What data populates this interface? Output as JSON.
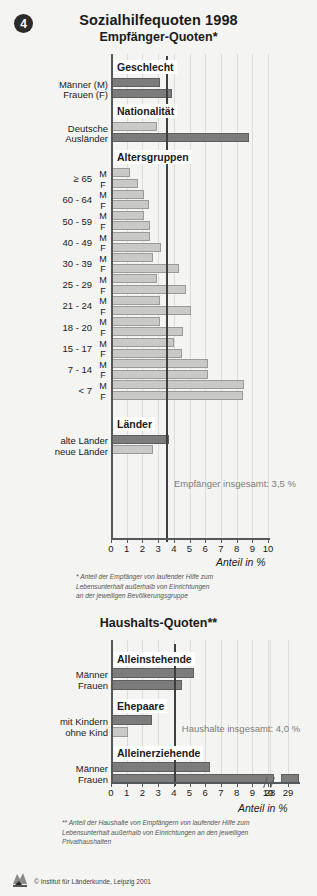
{
  "badge": {
    "number": "4"
  },
  "header": {
    "title": "Sozialhilfequoten 1998",
    "subtitle_top": "Empfänger-Quoten*",
    "subtitle_bottom": "Haushalts-Quoten**"
  },
  "axis": {
    "caption": "Anteil in %",
    "ticks_top": [
      "0",
      "1",
      "2",
      "3",
      "4",
      "5",
      "6",
      "7",
      "8",
      "9",
      "10"
    ],
    "ticks_bottom": [
      "0",
      "1",
      "2",
      "3",
      "4",
      "5",
      "6",
      "7",
      "8",
      "9",
      "10",
      "28",
      "29"
    ]
  },
  "annotations": {
    "top_reference": "Empfänger insgesamt: 3,5 %",
    "bottom_reference": "Haushalte insgesamt: 4,0 %"
  },
  "footnotes": {
    "one": "* Anteil der Empfänger von laufender Hilfe zum\nLebensunterhalt außerhalb von Einrichtungen\nan der jeweiligen Bevölkerungsgruppe",
    "two": "** Anteil der Haushalte von Empfängern von laufender Hilfe zum\nLebensunterhalt außerhalb von Einrichtungen an den jeweiligen\nPrivathaushalten"
  },
  "copyright": "© Institut für Länderkunde, Leipzig 2001",
  "colors": {
    "bar_dark": "#7c7c7c",
    "bar_light": "#c9c9c7",
    "reference_line": "#3d3f41",
    "axis": "#55585a",
    "background": "#f4f4f2"
  },
  "chart_data": [
    {
      "type": "bar",
      "orientation": "horizontal",
      "title": "Sozialhilfequoten 1998 — Empfänger-Quoten*",
      "xlabel": "Anteil in %",
      "ylabel": "",
      "xlim": [
        0,
        10
      ],
      "grid": true,
      "reference_line": {
        "value": 3.5,
        "label": "Empfänger insgesamt: 3,5 %"
      },
      "groups": [
        {
          "name": "Geschlecht",
          "rows": [
            {
              "label": "Männer (M)",
              "sex": "",
              "value": 3.1,
              "shade": "dark"
            },
            {
              "label": "Frauen (F)",
              "sex": "",
              "value": 3.9,
              "shade": "dark"
            }
          ]
        },
        {
          "name": "Nationalität",
          "rows": [
            {
              "label": "Deutsche",
              "sex": "",
              "value": 2.9,
              "shade": "light"
            },
            {
              "label": "Ausländer",
              "sex": "",
              "value": 8.8,
              "shade": "dark"
            }
          ]
        },
        {
          "name": "Altersgruppen",
          "rows": [
            {
              "label": "≥ 65",
              "sex": "M",
              "value": 1.2,
              "shade": "light"
            },
            {
              "label": "≥ 65",
              "sex": "F",
              "value": 1.7,
              "shade": "light"
            },
            {
              "label": "60 - 64",
              "sex": "M",
              "value": 2.1,
              "shade": "light"
            },
            {
              "label": "60 - 64",
              "sex": "F",
              "value": 2.4,
              "shade": "light"
            },
            {
              "label": "50 - 59",
              "sex": "M",
              "value": 2.1,
              "shade": "light"
            },
            {
              "label": "50 - 59",
              "sex": "F",
              "value": 2.5,
              "shade": "light"
            },
            {
              "label": "40 - 49",
              "sex": "M",
              "value": 2.5,
              "shade": "light"
            },
            {
              "label": "40 - 49",
              "sex": "F",
              "value": 3.2,
              "shade": "light"
            },
            {
              "label": "30 - 39",
              "sex": "M",
              "value": 2.7,
              "shade": "light"
            },
            {
              "label": "30 - 39",
              "sex": "F",
              "value": 4.3,
              "shade": "light"
            },
            {
              "label": "25 - 29",
              "sex": "M",
              "value": 2.9,
              "shade": "light"
            },
            {
              "label": "25 - 29",
              "sex": "F",
              "value": 4.8,
              "shade": "light"
            },
            {
              "label": "21 - 24",
              "sex": "M",
              "value": 3.1,
              "shade": "light"
            },
            {
              "label": "21 - 24",
              "sex": "F",
              "value": 5.1,
              "shade": "light"
            },
            {
              "label": "18 - 20",
              "sex": "M",
              "value": 3.1,
              "shade": "light"
            },
            {
              "label": "18 - 20",
              "sex": "F",
              "value": 4.6,
              "shade": "light"
            },
            {
              "label": "15 - 17",
              "sex": "M",
              "value": 4.0,
              "shade": "light"
            },
            {
              "label": "15 - 17",
              "sex": "F",
              "value": 4.5,
              "shade": "light"
            },
            {
              "label": "7 - 14",
              "sex": "M",
              "value": 6.2,
              "shade": "light"
            },
            {
              "label": "7 - 14",
              "sex": "F",
              "value": 6.2,
              "shade": "light"
            },
            {
              "label": "< 7",
              "sex": "M",
              "value": 8.5,
              "shade": "light"
            },
            {
              "label": "< 7",
              "sex": "F",
              "value": 8.4,
              "shade": "light"
            }
          ]
        },
        {
          "name": "Länder",
          "rows": [
            {
              "label": "alte Länder",
              "sex": "",
              "value": 3.7,
              "shade": "dark"
            },
            {
              "label": "neue Länder",
              "sex": "",
              "value": 2.7,
              "shade": "light"
            }
          ]
        }
      ]
    },
    {
      "type": "bar",
      "orientation": "horizontal",
      "title": "Haushalts-Quoten**",
      "xlabel": "Anteil in %",
      "ylabel": "",
      "xlim": [
        0,
        10
      ],
      "axis_break": {
        "after": 10,
        "resume_labels": [
          "28",
          "29"
        ]
      },
      "grid": true,
      "reference_line": {
        "value": 4.0,
        "label": "Haushalte insgesamt: 4,0 %"
      },
      "groups": [
        {
          "name": "Alleinstehende",
          "rows": [
            {
              "label": "Männer",
              "value": 5.3,
              "shade": "dark"
            },
            {
              "label": "Frauen",
              "value": 4.5,
              "shade": "dark"
            }
          ]
        },
        {
          "name": "Ehepaare",
          "rows": [
            {
              "label": "mit Kindern",
              "value": 2.6,
              "shade": "dark"
            },
            {
              "label": "ohne Kind",
              "value": 1.1,
              "shade": "light"
            }
          ]
        },
        {
          "name": "Alleinerziehende",
          "rows": [
            {
              "label": "Männer",
              "value": 6.3,
              "shade": "dark"
            },
            {
              "label": "Frauen",
              "value": 28.2,
              "shade": "dark",
              "broken": true
            }
          ]
        }
      ]
    }
  ]
}
